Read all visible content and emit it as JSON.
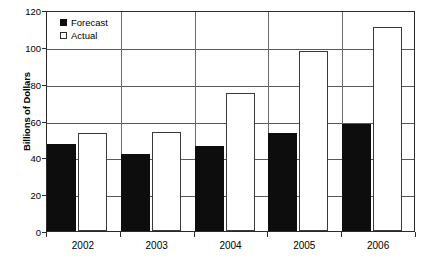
{
  "chart_data": {
    "type": "bar",
    "title": "",
    "subtitle": "",
    "xlabel": "",
    "ylabel": "Billions of Dollars",
    "categories": [
      "2002",
      "2003",
      "2004",
      "2005",
      "2006"
    ],
    "series": [
      {
        "name": "Forecast",
        "values": [
          47,
          42,
          46,
          53,
          58
        ],
        "color": "#0d0d0d",
        "fill": "solid-black"
      },
      {
        "name": "Actual",
        "values": [
          53,
          54,
          75,
          98,
          111
        ],
        "color": "#ffffff",
        "fill": "white-outlined"
      }
    ],
    "ylim": [
      0,
      120
    ],
    "yticks": [
      0,
      20,
      40,
      60,
      80,
      100,
      120
    ],
    "ytick_labels": [
      "0",
      "20",
      "40",
      "60",
      "80",
      "100",
      "120"
    ],
    "grid": true,
    "grid_axis": "y",
    "legend_position": "top-left",
    "legend_entries": [
      "Forecast",
      "Actual"
    ]
  },
  "legend": {
    "items": [
      {
        "label": "Forecast",
        "swatch": "filled-black-square"
      },
      {
        "label": "Actual",
        "swatch": "white-outlined-square"
      }
    ]
  },
  "axes": {
    "y_title": "Billions of Dollars"
  }
}
